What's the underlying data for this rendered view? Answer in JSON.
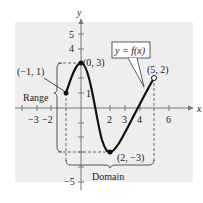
{
  "figure": {
    "axes": {
      "x_label": "x",
      "y_label": "y"
    },
    "x_ticks": [
      {
        "value": -3,
        "label": "−3"
      },
      {
        "value": -2,
        "label": "−2"
      },
      {
        "value": 2,
        "label": "2"
      },
      {
        "value": 3,
        "label": "3"
      },
      {
        "value": 4,
        "label": "4"
      },
      {
        "value": 6,
        "label": "6"
      }
    ],
    "y_ticks": [
      {
        "value": 5,
        "label": "5"
      },
      {
        "value": 4,
        "label": "4"
      },
      {
        "value": 1,
        "label": "1"
      },
      {
        "value": -5,
        "label": "−5"
      }
    ],
    "points": {
      "start": {
        "label": "(−1, 1)",
        "x": -1,
        "y": 1,
        "filled": true
      },
      "max": {
        "label": "(0, 3)",
        "x": 0,
        "y": 3,
        "filled": true
      },
      "min": {
        "label": "(2, −3)",
        "x": 2,
        "y": -3,
        "filled": true
      },
      "end": {
        "label": "(5, 2)",
        "x": 5,
        "y": 2,
        "filled": false
      }
    },
    "function_label": "y = f(x)",
    "range_label": "Range",
    "domain_label": "Domain",
    "colors": {
      "grid_bg": "#eeeeee",
      "curve": "#111111",
      "axis": "#777777",
      "dashed": "#444444"
    }
  }
}
